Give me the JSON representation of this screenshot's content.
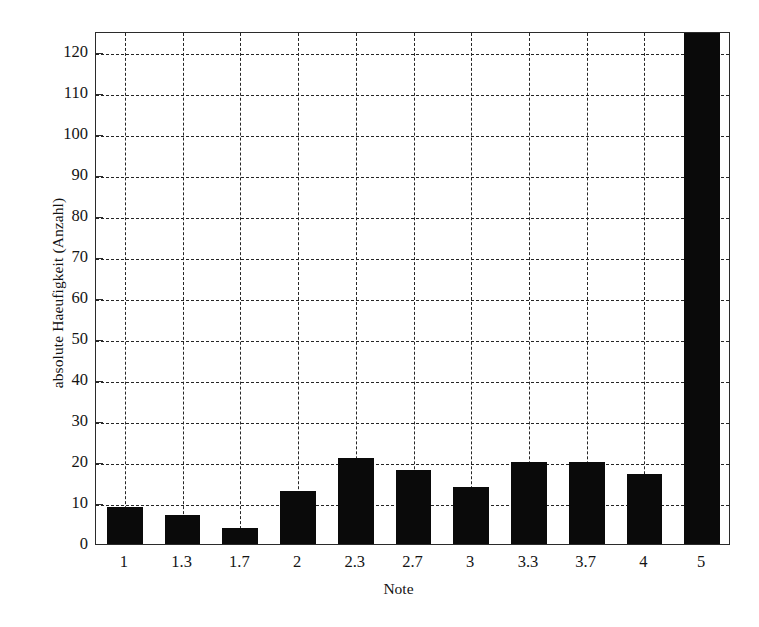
{
  "chart_data": {
    "type": "bar",
    "title": "",
    "xlabel": "Note",
    "ylabel": "absolute Haeufigkeit (Anzahl)",
    "categories": [
      "1",
      "1.3",
      "1.7",
      "2",
      "2.3",
      "2.7",
      "3",
      "3.3",
      "3.7",
      "4",
      "5"
    ],
    "values": [
      9,
      7,
      4,
      13,
      21,
      18,
      14,
      20,
      20,
      17,
      128
    ],
    "ylim": [
      0,
      125
    ],
    "ytick_labels": [
      "0",
      "10",
      "20",
      "30",
      "40",
      "50",
      "60",
      "70",
      "80",
      "90",
      "100",
      "110",
      "120"
    ],
    "ytick_values": [
      0,
      10,
      20,
      30,
      40,
      50,
      60,
      70,
      80,
      90,
      100,
      110,
      120
    ],
    "grid": true,
    "grid_style": "dashed",
    "legend": "none",
    "bar_color": "#0a0a0a",
    "axis_color": "#2b2b2b"
  },
  "axes": {
    "y_title": "absolute Haeufigkeit (Anzahl)",
    "x_title": "Note"
  }
}
